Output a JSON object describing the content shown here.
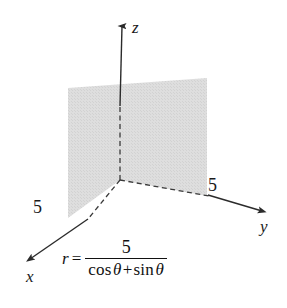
{
  "figure": {
    "kind": "3d-coordinate-plane-diagram",
    "background_color": "#ffffff",
    "width": 287,
    "height": 308
  },
  "axes": {
    "x_label": "x",
    "y_label": "y",
    "z_label": "z",
    "line_color": "#2b2b2b",
    "origin": {
      "x": 120,
      "y": 180
    }
  },
  "intercepts": {
    "x_value": "5",
    "y_value": "5"
  },
  "plane": {
    "fill_color": "#dcdcdc",
    "edge_color": "#3a3a3a",
    "dash_pattern": "5,3"
  },
  "equation": {
    "lhs": "r",
    "equals": "=",
    "numerator": "5",
    "denominator": {
      "cos": "cos",
      "theta1": "θ",
      "plus": "+",
      "sin": "sin",
      "theta2": "θ"
    },
    "plain_text": "r = 5 / (cos θ + sin θ)"
  }
}
